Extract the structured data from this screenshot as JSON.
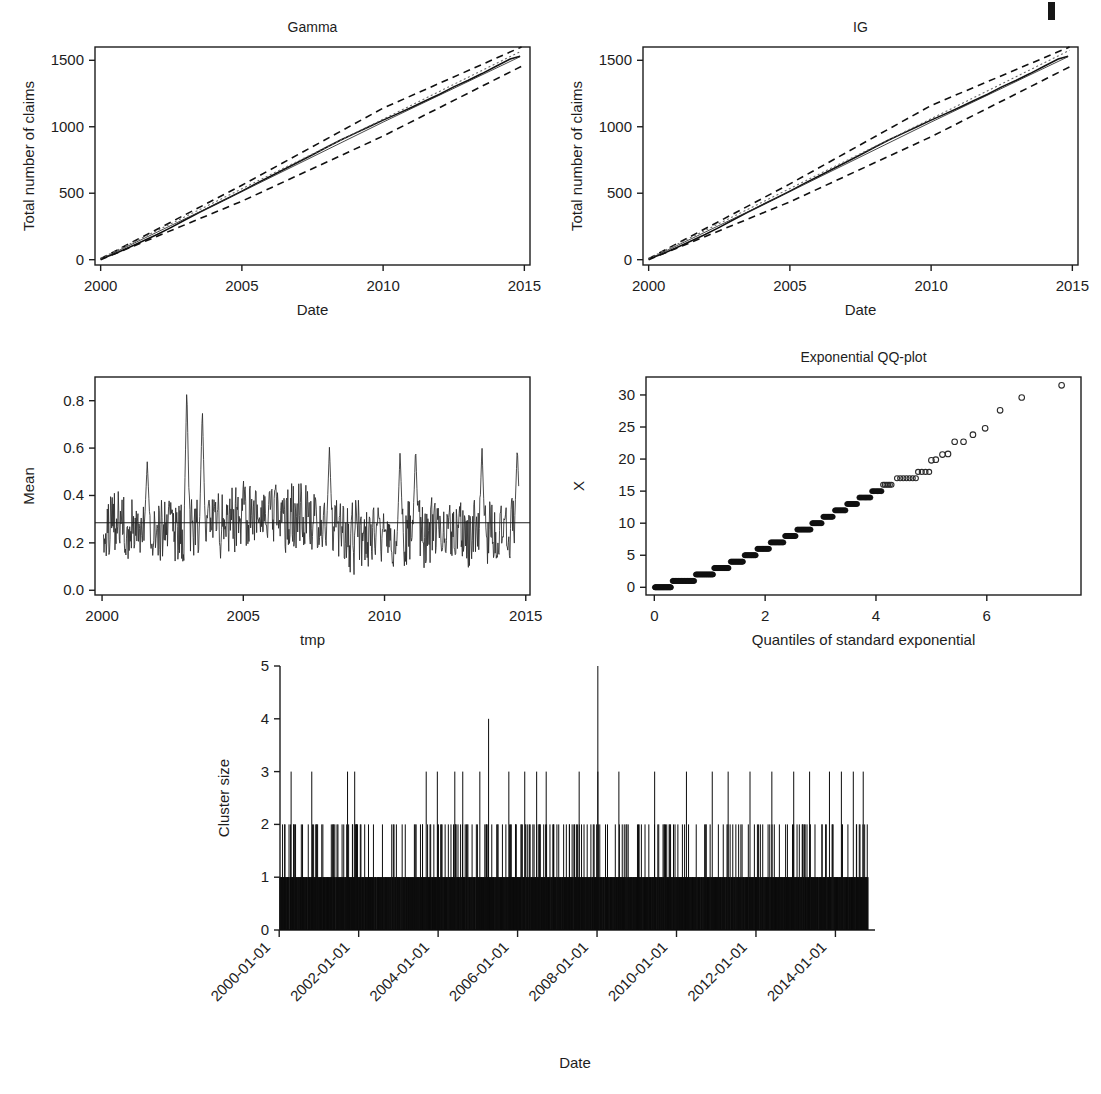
{
  "figure": {
    "background": "#ffffff",
    "foreground": "#1d1d1d",
    "page_mark_label": "page-edge-mark"
  },
  "chart_data": [
    {
      "id": "gamma-cumulative",
      "type": "line",
      "title": "Gamma",
      "xlabel": "Date",
      "ylabel": "Total number of claims",
      "xlim": [
        1999.8,
        2015.2
      ],
      "ylim": [
        -40,
        1600
      ],
      "xticks": [
        2000,
        2005,
        2010,
        2015
      ],
      "xticklabels": [
        "2000",
        "2005",
        "2010",
        "2015"
      ],
      "yticks": [
        0,
        500,
        1000,
        1500
      ],
      "yticklabels": [
        "0",
        "500",
        "1000",
        "1500"
      ],
      "grid": false,
      "legend": "none",
      "series": [
        {
          "name": "Observed cumulative claims",
          "style": "solid",
          "x": [
            2000.0,
            2000.5,
            2001.0,
            2001.5,
            2002.0,
            2002.5,
            2003.0,
            2003.5,
            2004.0,
            2004.5,
            2005.0,
            2005.5,
            2006.0,
            2006.5,
            2007.0,
            2007.5,
            2008.0,
            2008.5,
            2009.0,
            2009.5,
            2010.0,
            2010.5,
            2011.0,
            2011.5,
            2012.0,
            2012.5,
            2013.0,
            2013.5,
            2014.0,
            2014.5,
            2014.85
          ],
          "values": [
            6,
            45,
            92,
            140,
            190,
            243,
            300,
            356,
            410,
            462,
            516,
            572,
            626,
            680,
            735,
            790,
            846,
            900,
            950,
            1000,
            1050,
            1097,
            1145,
            1195,
            1245,
            1300,
            1348,
            1400,
            1455,
            1510,
            1530
          ]
        },
        {
          "name": "Fitted mean",
          "style": "thin",
          "x": [
            2000.0,
            2005.0,
            2010.0,
            2014.85
          ],
          "values": [
            4,
            512,
            1035,
            1527
          ]
        },
        {
          "name": "Upper confidence band",
          "style": "dashed",
          "x": [
            2000.0,
            2005.0,
            2010.0,
            2014.9
          ],
          "values": [
            8,
            560,
            1140,
            1600
          ]
        },
        {
          "name": "Lower confidence band",
          "style": "dashed",
          "x": [
            2000.0,
            2005.0,
            2010.0,
            2014.9
          ],
          "values": [
            0,
            440,
            930,
            1455
          ]
        },
        {
          "name": "Reference straight line",
          "style": "dotted",
          "x": [
            2000.0,
            2014.9
          ],
          "values": [
            10,
            1570
          ]
        }
      ]
    },
    {
      "id": "ig-cumulative",
      "type": "line",
      "title": "IG",
      "xlabel": "Date",
      "ylabel": "Total number of claims",
      "xlim": [
        1999.8,
        2015.2
      ],
      "ylim": [
        -40,
        1600
      ],
      "xticks": [
        2000,
        2005,
        2010,
        2015
      ],
      "xticklabels": [
        "2000",
        "2005",
        "2010",
        "2015"
      ],
      "yticks": [
        0,
        500,
        1000,
        1500
      ],
      "yticklabels": [
        "0",
        "500",
        "1000",
        "1500"
      ],
      "grid": false,
      "legend": "none",
      "series": [
        {
          "name": "Observed cumulative claims",
          "style": "solid",
          "x": [
            2000.0,
            2000.5,
            2001.0,
            2001.5,
            2002.0,
            2002.5,
            2003.0,
            2003.5,
            2004.0,
            2004.5,
            2005.0,
            2005.5,
            2006.0,
            2006.5,
            2007.0,
            2007.5,
            2008.0,
            2008.5,
            2009.0,
            2009.5,
            2010.0,
            2010.5,
            2011.0,
            2011.5,
            2012.0,
            2012.5,
            2013.0,
            2013.5,
            2014.0,
            2014.5,
            2014.85
          ],
          "values": [
            6,
            45,
            92,
            140,
            190,
            243,
            300,
            356,
            410,
            462,
            516,
            572,
            626,
            680,
            735,
            790,
            846,
            900,
            950,
            1000,
            1050,
            1097,
            1145,
            1195,
            1245,
            1300,
            1348,
            1400,
            1455,
            1510,
            1530
          ]
        },
        {
          "name": "Fitted mean",
          "style": "thin",
          "x": [
            2000.0,
            2005.0,
            2010.0,
            2014.85
          ],
          "values": [
            4,
            512,
            1035,
            1527
          ]
        },
        {
          "name": "Upper confidence band",
          "style": "dashed",
          "x": [
            2000.0,
            2005.0,
            2010.0,
            2014.9
          ],
          "values": [
            8,
            570,
            1160,
            1600
          ]
        },
        {
          "name": "Lower confidence band",
          "style": "dashed",
          "x": [
            2000.0,
            2005.0,
            2010.0,
            2014.9
          ],
          "values": [
            0,
            435,
            925,
            1450
          ]
        },
        {
          "name": "Reference straight line",
          "style": "dotted",
          "x": [
            2000.0,
            2014.9
          ],
          "values": [
            10,
            1575
          ]
        }
      ]
    },
    {
      "id": "mean-series",
      "type": "line",
      "title": "",
      "xlabel": "tmp",
      "ylabel": "Mean",
      "xlim": [
        1999.75,
        2015.15
      ],
      "ylim": [
        -0.02,
        0.9
      ],
      "xticks": [
        2000,
        2005,
        2010,
        2015
      ],
      "xticklabels": [
        "2000",
        "2005",
        "2010",
        "2015"
      ],
      "yticks": [
        0.0,
        0.2,
        0.4,
        0.6,
        0.8
      ],
      "yticklabels": [
        "0.0",
        "0.2",
        "0.4",
        "0.6",
        "0.8"
      ],
      "grid": false,
      "legend": "none",
      "reference_line": {
        "name": "overall mean",
        "y": 0.285
      },
      "noise": {
        "n_points": 760,
        "x_start": 2000.05,
        "x_end": 2014.75,
        "base_level": 0.27,
        "amplitude": 0.11,
        "seed": 20240117,
        "max_peak": 0.88,
        "min_trough": 0.01,
        "peaks": [
          {
            "x": 2003.0,
            "y": 0.88
          },
          {
            "x": 2003.55,
            "y": 0.79
          },
          {
            "x": 2001.6,
            "y": 0.555
          },
          {
            "x": 2008.05,
            "y": 0.62
          },
          {
            "x": 2010.55,
            "y": 0.6
          },
          {
            "x": 2011.1,
            "y": 0.62
          },
          {
            "x": 2013.45,
            "y": 0.62
          },
          {
            "x": 2014.7,
            "y": 0.62
          }
        ]
      }
    },
    {
      "id": "exponential-qq",
      "type": "scatter",
      "title": "Exponential QQ-plot",
      "xlabel": "Quantiles of standard exponential",
      "ylabel": "X",
      "xlim": [
        -0.15,
        7.7
      ],
      "ylim": [
        -1.2,
        32.8
      ],
      "xticks": [
        0,
        2,
        4,
        6
      ],
      "xticklabels": [
        "0",
        "2",
        "4",
        "6"
      ],
      "yticks": [
        0,
        5,
        10,
        15,
        20,
        25,
        30
      ],
      "yticklabels": [
        "0",
        "5",
        "10",
        "15",
        "20",
        "25",
        "30"
      ],
      "grid": false,
      "legend": "none",
      "marker": "open-circle",
      "description": "Heavily tied integer responses form horizontal bands; upper tail thins out to single points.",
      "bands": [
        {
          "y": 0,
          "x_start": 0.01,
          "x_end": 0.3,
          "count": 34
        },
        {
          "y": 1,
          "x_start": 0.33,
          "x_end": 0.72,
          "count": 30
        },
        {
          "y": 2,
          "x_start": 0.75,
          "x_end": 1.06,
          "count": 26
        },
        {
          "y": 3,
          "x_start": 1.08,
          "x_end": 1.34,
          "count": 22
        },
        {
          "y": 4,
          "x_start": 1.38,
          "x_end": 1.6,
          "count": 20
        },
        {
          "y": 5,
          "x_start": 1.63,
          "x_end": 1.83,
          "count": 18
        },
        {
          "y": 6,
          "x_start": 1.86,
          "x_end": 2.07,
          "count": 17
        },
        {
          "y": 7,
          "x_start": 2.1,
          "x_end": 2.33,
          "count": 17
        },
        {
          "y": 8,
          "x_start": 2.36,
          "x_end": 2.55,
          "count": 15
        },
        {
          "y": 9,
          "x_start": 2.58,
          "x_end": 2.82,
          "count": 16
        },
        {
          "y": 10,
          "x_start": 2.85,
          "x_end": 3.02,
          "count": 13
        },
        {
          "y": 11,
          "x_start": 3.05,
          "x_end": 3.22,
          "count": 12
        },
        {
          "y": 12,
          "x_start": 3.26,
          "x_end": 3.45,
          "count": 12
        },
        {
          "y": 13,
          "x_start": 3.48,
          "x_end": 3.66,
          "count": 11
        },
        {
          "y": 14,
          "x_start": 3.7,
          "x_end": 3.9,
          "count": 10
        },
        {
          "y": 15,
          "x_start": 3.93,
          "x_end": 4.1,
          "count": 8
        },
        {
          "y": 16,
          "x_start": 4.13,
          "x_end": 4.28,
          "count": 6
        },
        {
          "y": 17,
          "x_start": 4.38,
          "x_end": 4.72,
          "count": 7
        },
        {
          "y": 18,
          "x_start": 4.76,
          "x_end": 4.96,
          "count": 4
        }
      ],
      "tail_points": [
        {
          "x": 5.0,
          "y": 19.8
        },
        {
          "x": 5.08,
          "y": 19.9
        },
        {
          "x": 5.2,
          "y": 20.7
        },
        {
          "x": 5.3,
          "y": 20.8
        },
        {
          "x": 5.42,
          "y": 22.7
        },
        {
          "x": 5.58,
          "y": 22.7
        },
        {
          "x": 5.75,
          "y": 23.8
        },
        {
          "x": 5.97,
          "y": 24.8
        },
        {
          "x": 6.24,
          "y": 27.6
        },
        {
          "x": 6.63,
          "y": 29.6
        },
        {
          "x": 7.35,
          "y": 31.5
        }
      ]
    },
    {
      "id": "cluster-size-spikes",
      "type": "bar",
      "title": "",
      "xlabel": "Date",
      "ylabel": "Cluster size",
      "xlim": [
        2000.0,
        2015.0
      ],
      "ylim": [
        0,
        5
      ],
      "xticks": [
        "2000-01-01",
        "2002-01-01",
        "2004-01-01",
        "2006-01-01",
        "2008-01-01",
        "2010-01-01",
        "2012-01-01",
        "2014-01-01"
      ],
      "xticklabels": [
        "2000-01-01",
        "2002-01-01",
        "2004-01-01",
        "2006-01-01",
        "2008-01-01",
        "2010-01-01",
        "2012-01-01",
        "2014-01-01"
      ],
      "xtick_rotation_deg": 45,
      "yticks": [
        0,
        1,
        2,
        3,
        4,
        5
      ],
      "yticklabels": [
        "0",
        "1",
        "2",
        "3",
        "4",
        "5"
      ],
      "grid": false,
      "legend": "none",
      "frame": "axes-only",
      "description": "Dense spike (impulse) plot of claim cluster sizes over 15 years; the vast majority of clusters are size 1, many are size 2, scattered 3s, one 4 and one 5.",
      "n_spikes": 1530,
      "x_data_start": 2000.02,
      "x_data_end": 2014.82,
      "density_profile": "uniform-dense",
      "size_counts": {
        "1": 1265,
        "2": 232,
        "3": 31,
        "4": 1,
        "5": 1
      },
      "notable_spikes": [
        {
          "x": 2005.27,
          "size": 4
        },
        {
          "x": 2008.02,
          "size": 5
        }
      ],
      "size3_positions": [
        2000.3,
        2000.82,
        2001.72,
        2001.9,
        2003.7,
        2003.98,
        2004.42,
        2004.62,
        2005.05,
        2005.78,
        2006.18,
        2006.48,
        2006.72,
        2007.55,
        2008.02,
        2008.55,
        2009.45,
        2010.25,
        2010.9,
        2011.3,
        2011.85,
        2012.4,
        2012.95,
        2013.35,
        2013.85,
        2014.15,
        2014.45,
        2014.7
      ],
      "seed": 7731
    }
  ]
}
